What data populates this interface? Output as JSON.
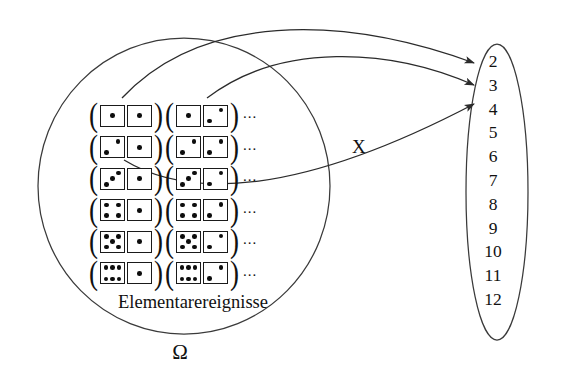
{
  "figure": {
    "type": "probability-mapping-diagram",
    "sample_space": {
      "label": "Elementarereignisse",
      "symbol": "Ω",
      "ellipsis": "...",
      "open_paren": "(",
      "close_paren": ")",
      "rows": [
        {
          "pairs": [
            [
              1,
              1
            ],
            [
              1,
              2
            ]
          ]
        },
        {
          "pairs": [
            [
              2,
              1
            ],
            [
              2,
              2
            ]
          ]
        },
        {
          "pairs": [
            [
              3,
              1
            ],
            [
              3,
              2
            ]
          ]
        },
        {
          "pairs": [
            [
              4,
              1
            ],
            [
              4,
              2
            ]
          ]
        },
        {
          "pairs": [
            [
              5,
              1
            ],
            [
              5,
              2
            ]
          ]
        },
        {
          "pairs": [
            [
              6,
              1
            ],
            [
              6,
              2
            ]
          ]
        }
      ]
    },
    "mapping": {
      "label": "X",
      "arrows": [
        {
          "from_row": 1,
          "to_value": "2"
        },
        {
          "from_row": 1,
          "to_value": "3"
        },
        {
          "from_row": 2,
          "to_value": "4"
        }
      ]
    },
    "value_set": {
      "values": [
        "2",
        "3",
        "4",
        "5",
        "6",
        "7",
        "8",
        "9",
        "10",
        "11",
        "12"
      ]
    },
    "colors": {
      "stroke": "#3a3a3a",
      "ink": "#111111",
      "background": "#ffffff"
    }
  }
}
